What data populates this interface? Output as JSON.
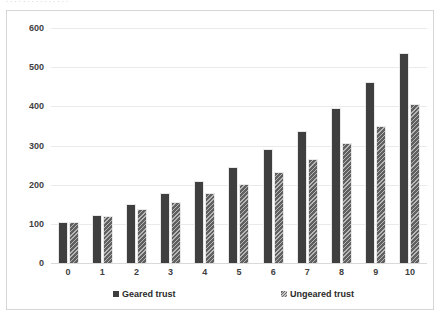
{
  "top_strip": {
    "visible_fragment": ". . . . . . . . . . . . . . ."
  },
  "legend": {
    "position": "bottom",
    "items": [
      {
        "label": "Geared trust",
        "color": "#3f3f3f",
        "pattern": "solid"
      },
      {
        "label": "Ungeared trust",
        "color": "#6d6d6d",
        "pattern": "diagonal-hatch"
      }
    ]
  },
  "chart_data": {
    "type": "bar",
    "title": "",
    "subtitle": "",
    "xlabel": "",
    "ylabel": "",
    "categories": [
      "0",
      "1",
      "2",
      "3",
      "4",
      "5",
      "6",
      "7",
      "8",
      "9",
      "10"
    ],
    "series": [
      {
        "name": "Geared trust",
        "color": "#3f3f3f",
        "values": [
          105,
          122,
          150,
          178,
          210,
          245,
          290,
          338,
          396,
          462,
          535
        ]
      },
      {
        "name": "Ungeared trust",
        "color": "#6d6d6d",
        "values": [
          104,
          120,
          138,
          157,
          178,
          202,
          232,
          265,
          307,
          350,
          405
        ]
      }
    ],
    "ylim": [
      0,
      600
    ],
    "yticks": [
      0,
      100,
      200,
      300,
      400,
      500,
      600
    ],
    "ytick_labels": [
      "0",
      "100",
      "200",
      "300",
      "400",
      "500",
      "600"
    ],
    "grid": true,
    "grid_axis": "y",
    "legend_position": "bottom"
  }
}
